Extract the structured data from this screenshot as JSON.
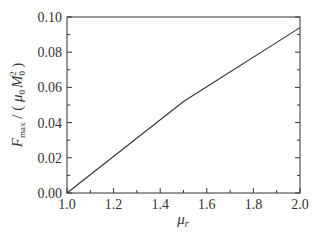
{
  "chart_data": {
    "type": "line",
    "title": "",
    "xlabel": "μ_r",
    "ylabel": "F_max / ( μ_0 M_0^2 )",
    "xlim": [
      1.0,
      2.0
    ],
    "ylim": [
      0.0,
      0.1
    ],
    "x_ticks": [
      "1.0",
      "1.2",
      "1.4",
      "1.6",
      "1.8",
      "2.0"
    ],
    "y_ticks": [
      "0.00",
      "0.02",
      "0.04",
      "0.06",
      "0.08",
      "0.10"
    ],
    "grid": false,
    "legend": null,
    "series": [
      {
        "name": "F_max",
        "x": [
          1.0,
          1.5,
          2.0
        ],
        "y": [
          0.0,
          0.052,
          0.094
        ]
      }
    ]
  },
  "labels": {
    "x_main": "μ",
    "x_sub": "r",
    "y_F": "F",
    "y_sub": "max",
    "y_rest1": " / ( ",
    "y_mu": "μ",
    "y_mu_sub": "0",
    "y_M": "M",
    "y_M_sub": "0",
    "y_M_sup": "2",
    "y_rest2": " )"
  },
  "colors": {
    "axis": "#333333",
    "line": "#333333"
  }
}
